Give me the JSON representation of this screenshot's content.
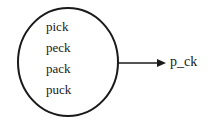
{
  "diagram": {
    "set_words": [
      "pick",
      "peck",
      "pack",
      "puck"
    ],
    "output_label": "p_ck",
    "stroke_color": "#1a1a1a"
  }
}
